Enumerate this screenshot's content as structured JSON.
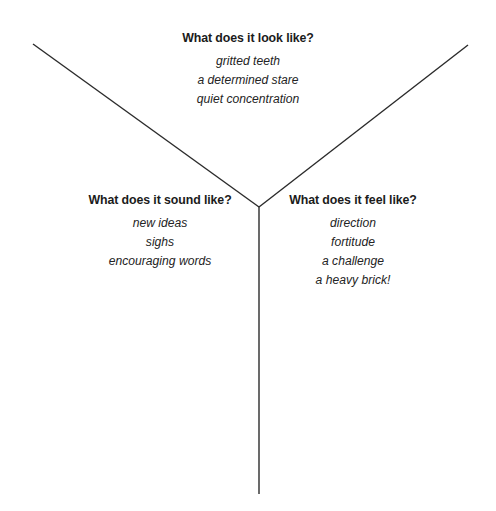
{
  "diagram": {
    "type": "y-chart",
    "background_color": "#ffffff",
    "line_color": "#2b2b2b",
    "heading_color": "#1b1b1b",
    "item_color": "#242424",
    "junction": {
      "x": 259,
      "y": 207
    },
    "arms": [
      {
        "name": "upper-left-arm",
        "x1": 33,
        "y1": 44,
        "x2": 259,
        "y2": 207
      },
      {
        "name": "upper-right-arm",
        "x1": 468,
        "y1": 45,
        "x2": 259,
        "y2": 207
      },
      {
        "name": "lower-stem",
        "x1": 259,
        "y1": 207,
        "x2": 259,
        "y2": 494
      }
    ],
    "zones": [
      {
        "id": "look",
        "heading": "What does it look like?",
        "items": [
          "gritted teeth",
          "a determined stare",
          "quiet concentration"
        ]
      },
      {
        "id": "sound",
        "heading": "What does it sound like?",
        "items": [
          "new ideas",
          "sighs",
          "encouraging words"
        ]
      },
      {
        "id": "feel",
        "heading": "What does it feel like?",
        "items": [
          "direction",
          "fortitude",
          "a challenge",
          "a heavy brick!"
        ]
      }
    ]
  }
}
